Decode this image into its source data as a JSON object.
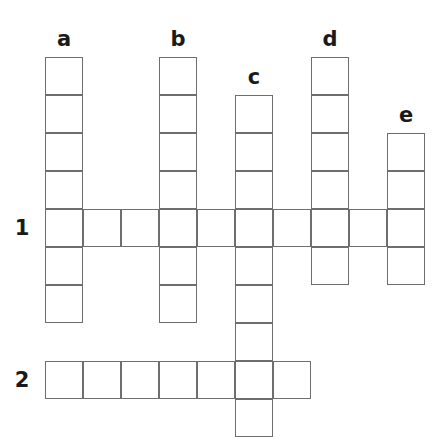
{
  "puzzle": {
    "type": "crossword-grid",
    "cell_size": 38,
    "origin_x": 45,
    "origin_y": 57,
    "border_color": "#6e6e6e",
    "label_color": "#1a1a1a",
    "background": "#ffffff",
    "column_labels": [
      {
        "text": "a",
        "col": 0
      },
      {
        "text": "b",
        "col": 3
      },
      {
        "text": "c",
        "col": 5
      },
      {
        "text": "d",
        "col": 7
      },
      {
        "text": "e",
        "col": 9
      }
    ],
    "row_labels": [
      {
        "text": "1",
        "row": 4
      },
      {
        "text": "2",
        "row": 8
      }
    ],
    "vertical_words": [
      {
        "name": "a",
        "col": 0,
        "start_row": 0,
        "length": 7
      },
      {
        "name": "b",
        "col": 3,
        "start_row": 0,
        "length": 7
      },
      {
        "name": "c",
        "col": 5,
        "start_row": 1,
        "length": 9
      },
      {
        "name": "d",
        "col": 7,
        "start_row": 0,
        "length": 6
      },
      {
        "name": "e",
        "col": 9,
        "start_row": 2,
        "length": 4
      }
    ],
    "horizontal_words": [
      {
        "name": "1",
        "row": 4,
        "start_col": 0,
        "length": 10
      },
      {
        "name": "2",
        "row": 8,
        "start_col": 0,
        "length": 7
      }
    ]
  }
}
